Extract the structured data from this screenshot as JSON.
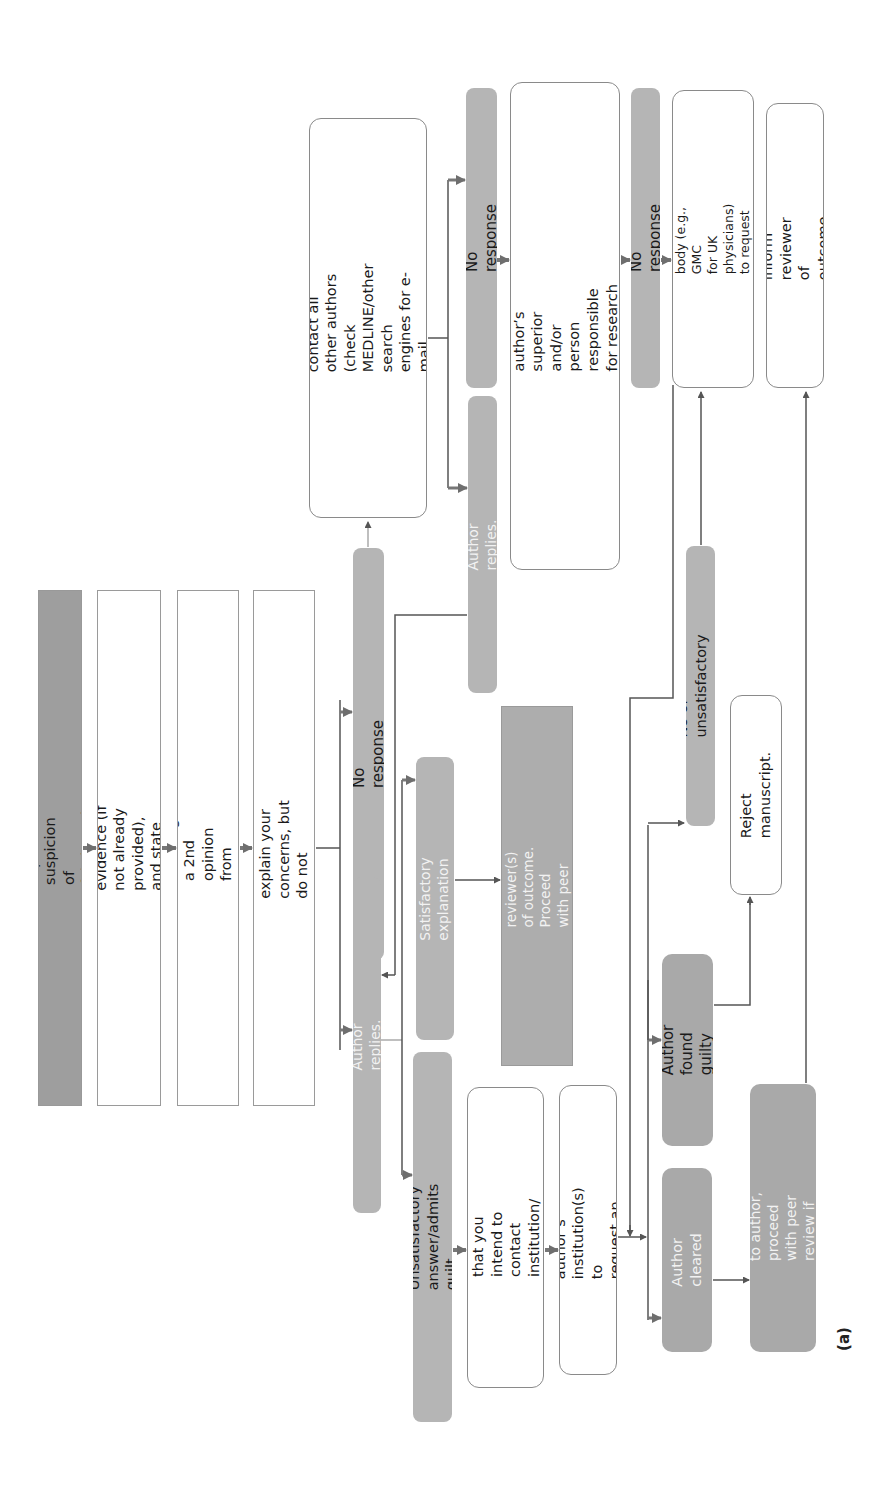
{
  "figure_label": "(a)",
  "nodes": {
    "reviewer_suspicion": "Reviewer expresses suspicion of fabricated data.",
    "thank_reviewer": "Thank reviewer, ask for evidence (if not already\nprovided), and state your plans to investigate.",
    "second_opinion": "Consider securing a 2nd opinion from another reviewer.",
    "contact_author": "Contact author to explain your concerns, but do not\nmake direct accusation(s).",
    "no_response_1": "No response",
    "author_replies_1": "Author replies.",
    "attempt_contact_others": "Attempt to contact all other authors (check\nMEDLINE/other search engines for e-mail\naddresses).",
    "no_response_2": "No response",
    "author_replies_2": "Author replies.",
    "contact_institution_concern": "Contact author’s institution to request that your\nconcern is passed to author’s superior and/or person\nresponsible for research governance, if necessary,\ncoordinating with coauthors’ institutions.",
    "no_response_3": "No response",
    "contact_regulatory": "Contact regulatory body (e.g., GMC\nfor UK physicians) to request an\ninquiry.",
    "inform_reviewer": "Inform reviewer of outcome.",
    "satisfactory_explanation": "Satisfactory explanation",
    "apologize_inform": "Apologize to author, inform reviewer(s)\nof outcome. Proceed with peer review\nif appropriate.",
    "unsatisfactory_answer": "Unsatisfactory answer/admits guilt",
    "inform_all_authors": "Inform all authors that you\nintend to contact institution/\nregulatory body.",
    "contact_institution_investigation": "Contact author’s institution(s) to\nrequest an investigation.",
    "no_or_unsatisfactory": "No or unsatisfactory response",
    "reject_manuscript": "Reject manuscript.",
    "author_found_guilty": "Author found guilty",
    "author_cleared": "Author cleared",
    "apologize_proceed": "Apologize to author, proceed\nwith peer review if appropriate."
  },
  "colors": {
    "dark_fill": "#9e9e9e",
    "mid_fill": "#b5b5b5",
    "line": "#555555",
    "arrow": "#6e6e6e"
  }
}
